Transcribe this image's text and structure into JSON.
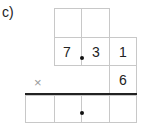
{
  "problem_label": "c)",
  "multiplicand": {
    "digits": [
      "7",
      "3",
      "1"
    ]
  },
  "multiplier": {
    "digit": "6"
  },
  "operator": "×"
}
